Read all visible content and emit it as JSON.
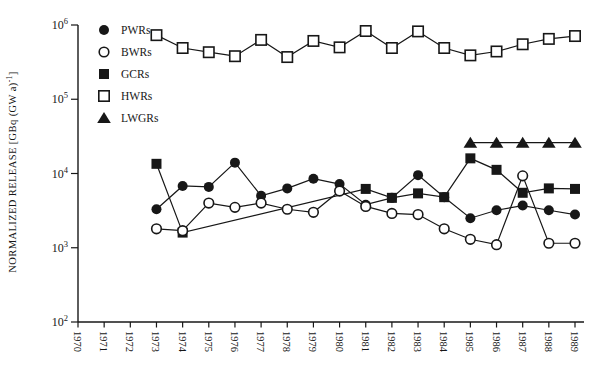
{
  "colors": {
    "ink": "#171717",
    "paper": "#ffffff"
  },
  "chart_data": {
    "type": "line",
    "title": "",
    "xlabel": "",
    "ylabel": {
      "main": "NORMALIZED RELEASE [GBq (GW a)",
      "sup": "-1",
      "end": "]"
    },
    "ylim": [
      100,
      1000000
    ],
    "xlim": [
      1970,
      1989
    ],
    "grid": false,
    "legend_position": "top-left-inside",
    "x_ticks": [
      1970,
      1971,
      1972,
      1973,
      1974,
      1975,
      1976,
      1977,
      1978,
      1979,
      1980,
      1981,
      1982,
      1983,
      1984,
      1985,
      1986,
      1987,
      1988,
      1989
    ],
    "y_ticks": [
      {
        "base": "10",
        "exp": "6",
        "value": 1000000
      },
      {
        "base": "10",
        "exp": "5",
        "value": 100000
      },
      {
        "base": "10",
        "exp": "4",
        "value": 10000
      },
      {
        "base": "10",
        "exp": "3",
        "value": 1000
      },
      {
        "base": "10",
        "exp": "2",
        "value": 100
      }
    ],
    "series": [
      {
        "name": "PWRs",
        "marker": "filled-circle",
        "points": [
          [
            1973,
            3300
          ],
          [
            1974,
            6800
          ],
          [
            1975,
            6600
          ],
          [
            1976,
            14000
          ],
          [
            1977,
            5000
          ],
          [
            1978,
            6300
          ],
          [
            1979,
            8500
          ],
          [
            1980,
            7200
          ],
          [
            1981,
            3800
          ],
          [
            1982,
            4700
          ],
          [
            1983,
            9500
          ],
          [
            1984,
            4800
          ],
          [
            1985,
            2500
          ],
          [
            1986,
            3200
          ],
          [
            1987,
            3700
          ],
          [
            1988,
            3200
          ],
          [
            1989,
            2800
          ]
        ]
      },
      {
        "name": "BWRs",
        "marker": "open-circle",
        "points": [
          [
            1973,
            1800
          ],
          [
            1974,
            1700
          ],
          [
            1975,
            4000
          ],
          [
            1976,
            3500
          ],
          [
            1977,
            4000
          ],
          [
            1978,
            3300
          ],
          [
            1979,
            3000
          ],
          [
            1980,
            5800
          ],
          [
            1981,
            3600
          ],
          [
            1982,
            2900
          ],
          [
            1983,
            2800
          ],
          [
            1984,
            1800
          ],
          [
            1985,
            1300
          ],
          [
            1986,
            1100
          ],
          [
            1987,
            9300
          ],
          [
            1988,
            1150
          ],
          [
            1989,
            1150
          ]
        ]
      },
      {
        "name": "GCRs",
        "marker": "filled-square",
        "points": [
          [
            1973,
            13500
          ],
          [
            1974,
            1600
          ],
          [
            1981,
            6200
          ],
          [
            1982,
            4700
          ],
          [
            1983,
            5400
          ],
          [
            1984,
            4800
          ],
          [
            1985,
            16000
          ],
          [
            1986,
            11200
          ],
          [
            1987,
            5500
          ],
          [
            1988,
            6300
          ],
          [
            1989,
            6200
          ]
        ]
      },
      {
        "name": "HWRs",
        "marker": "open-square",
        "points": [
          [
            1973,
            730000
          ],
          [
            1974,
            490000
          ],
          [
            1975,
            430000
          ],
          [
            1976,
            380000
          ],
          [
            1977,
            630000
          ],
          [
            1978,
            370000
          ],
          [
            1979,
            610000
          ],
          [
            1980,
            500000
          ],
          [
            1981,
            830000
          ],
          [
            1982,
            490000
          ],
          [
            1983,
            820000
          ],
          [
            1984,
            490000
          ],
          [
            1985,
            390000
          ],
          [
            1986,
            440000
          ],
          [
            1987,
            550000
          ],
          [
            1988,
            650000
          ],
          [
            1989,
            710000
          ]
        ]
      },
      {
        "name": "LWGRs",
        "marker": "filled-triangle",
        "points": [
          [
            1985,
            26000
          ],
          [
            1986,
            26000
          ],
          [
            1987,
            26000
          ],
          [
            1988,
            26000
          ],
          [
            1989,
            26000
          ]
        ]
      }
    ]
  }
}
